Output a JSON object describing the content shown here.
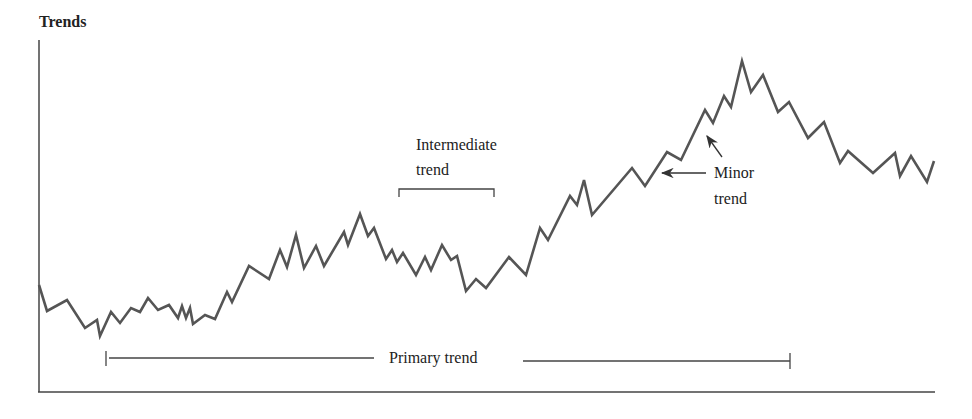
{
  "chart_data": {
    "type": "line",
    "title": "Trends",
    "xlabel": "",
    "ylabel": "",
    "grid": false,
    "legend": null,
    "annotations": [
      {
        "text": "Intermediate trend",
        "kind": "bracket",
        "x_range": [
          399,
          494
        ],
        "y": 189
      },
      {
        "text": "Minor trend",
        "kind": "arrows",
        "arrows_to": [
          [
            660,
            172
          ],
          [
            706,
            124
          ]
        ]
      },
      {
        "text": "Primary trend",
        "kind": "bracket",
        "x_range": [
          106,
          790
        ],
        "y": 361
      }
    ],
    "series": [
      {
        "name": "price",
        "color": "#555555",
        "points": [
          [
            39,
            285
          ],
          [
            47,
            311
          ],
          [
            67,
            300
          ],
          [
            85,
            328
          ],
          [
            97,
            320
          ],
          [
            100,
            336
          ],
          [
            111,
            312
          ],
          [
            120,
            323
          ],
          [
            131,
            308
          ],
          [
            140,
            312
          ],
          [
            148,
            298
          ],
          [
            158,
            310
          ],
          [
            169,
            305
          ],
          [
            178,
            318
          ],
          [
            182,
            306
          ],
          [
            186,
            318
          ],
          [
            190,
            308
          ],
          [
            193,
            324
          ],
          [
            205,
            315
          ],
          [
            215,
            319
          ],
          [
            227,
            292
          ],
          [
            232,
            302
          ],
          [
            249,
            266
          ],
          [
            269,
            279
          ],
          [
            280,
            250
          ],
          [
            287,
            267
          ],
          [
            296,
            235
          ],
          [
            304,
            268
          ],
          [
            316,
            246
          ],
          [
            324,
            266
          ],
          [
            344,
            232
          ],
          [
            348,
            245
          ],
          [
            360,
            214
          ],
          [
            368,
            236
          ],
          [
            374,
            228
          ],
          [
            386,
            259
          ],
          [
            392,
            250
          ],
          [
            397,
            262
          ],
          [
            403,
            253
          ],
          [
            416,
            275
          ],
          [
            425,
            257
          ],
          [
            431,
            270
          ],
          [
            442,
            245
          ],
          [
            451,
            260
          ],
          [
            457,
            256
          ],
          [
            466,
            291
          ],
          [
            476,
            279
          ],
          [
            486,
            288
          ],
          [
            509,
            257
          ],
          [
            526,
            275
          ],
          [
            540,
            228
          ],
          [
            548,
            240
          ],
          [
            570,
            196
          ],
          [
            577,
            205
          ],
          [
            584,
            180
          ],
          [
            592,
            215
          ],
          [
            632,
            168
          ],
          [
            645,
            186
          ],
          [
            667,
            152
          ],
          [
            681,
            160
          ],
          [
            705,
            110
          ],
          [
            713,
            123
          ],
          [
            724,
            96
          ],
          [
            731,
            107
          ],
          [
            742,
            61
          ],
          [
            751,
            92
          ],
          [
            763,
            75
          ],
          [
            778,
            112
          ],
          [
            789,
            102
          ],
          [
            808,
            138
          ],
          [
            824,
            122
          ],
          [
            840,
            163
          ],
          [
            848,
            151
          ],
          [
            873,
            173
          ],
          [
            895,
            153
          ],
          [
            900,
            176
          ],
          [
            911,
            156
          ],
          [
            927,
            182
          ],
          [
            934,
            161
          ]
        ]
      }
    ]
  },
  "labels": {
    "title": "Trends",
    "intermediate_1": "Intermediate",
    "intermediate_2": "trend",
    "minor_1": "Minor",
    "minor_2": "trend",
    "primary": "Primary trend"
  }
}
